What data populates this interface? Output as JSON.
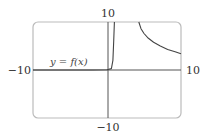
{
  "chart_data": {
    "type": "line",
    "title": "",
    "xlabel": "",
    "ylabel": "",
    "xlim": [
      -10,
      10
    ],
    "ylim": [
      -10,
      10
    ],
    "grid": false,
    "tick_labels": {
      "x_min": "−10",
      "x_max": "10",
      "y_min": "−10",
      "y_max": "10"
    },
    "annotations": [
      {
        "text": "y = f(x)",
        "x": -6,
        "y": 1.2
      }
    ],
    "series": [
      {
        "name": "y = f(x)",
        "segments": [
          {
            "x": [
              -10,
              -2,
              0,
              0.6,
              0.8,
              0.9,
              1.0
            ],
            "y": [
              0,
              0,
              0.05,
              0.3,
              2,
              6,
              10
            ]
          },
          {
            "x": [
              4.3,
              4.6,
              5.0,
              5.6,
              6.3,
              7.2,
              8.2,
              9.2,
              10
            ],
            "y": [
              10,
              8.6,
              7.6,
              6.6,
              5.8,
              5.0,
              4.3,
              3.8,
              3.4
            ]
          }
        ]
      }
    ],
    "colors": {
      "axis": "#555555",
      "frame": "#bbbbbb",
      "curve": "#444444"
    }
  }
}
